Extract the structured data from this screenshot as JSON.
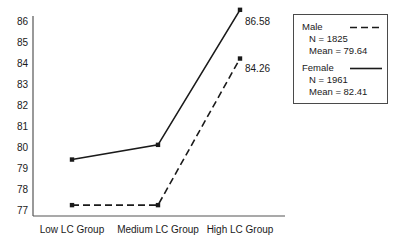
{
  "chart_data": {
    "type": "line",
    "title": "",
    "xlabel": "",
    "ylabel": "",
    "categories": [
      "Low LC Group",
      "Medium LC Group",
      "High LC Group"
    ],
    "ylim": [
      77,
      86
    ],
    "yticks": [
      77,
      78,
      79,
      80,
      81,
      82,
      83,
      84,
      85,
      86
    ],
    "grid": false,
    "legend_position": "right",
    "series": [
      {
        "name": "Male",
        "style": "dashed",
        "color": "#1a1a1a",
        "values": [
          77.28,
          77.28,
          84.26
        ],
        "n": "N = 1825",
        "mean": "Mean = 79.64",
        "end_label": "84.26"
      },
      {
        "name": "Female",
        "style": "solid",
        "color": "#1a1a1a",
        "values": [
          79.45,
          80.15,
          86.58
        ],
        "n": "N = 1961",
        "mean": "Mean = 82.41",
        "end_label": "86.58"
      }
    ],
    "annotations": [
      {
        "text": "86.58",
        "x": 2,
        "y": 86.58,
        "series": "Female"
      },
      {
        "text": "84.26",
        "x": 2,
        "y": 84.26,
        "series": "Male"
      }
    ]
  },
  "axes": {
    "ytick_labels": [
      "86",
      "85",
      "84",
      "83",
      "82",
      "81",
      "80",
      "79",
      "78",
      "77"
    ],
    "xtick_labels": [
      "Low LC Group",
      "Medium LC Group",
      "High LC Group"
    ]
  },
  "legend": {
    "male": {
      "label": "Male",
      "n": "N = 1825",
      "mean": "Mean = 79.64"
    },
    "female": {
      "label": "Female",
      "n": "N = 1961",
      "mean": "Mean = 82.41"
    }
  }
}
